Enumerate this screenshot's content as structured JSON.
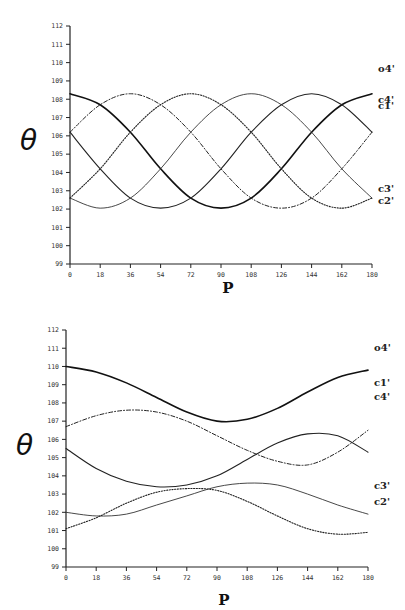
{
  "chart_data": [
    {
      "type": "line",
      "title": "",
      "xlabel": "P",
      "ylabel": "θ",
      "x": [
        0,
        18,
        36,
        54,
        72,
        90,
        108,
        126,
        144,
        162,
        180
      ],
      "xticks": [
        "0",
        "18",
        "36",
        "54",
        "72",
        "90",
        "108",
        "126",
        "144",
        "162",
        "180"
      ],
      "yticks": [
        "99",
        "100",
        "101",
        "102",
        "103",
        "104",
        "105",
        "106",
        "107",
        "108",
        "109",
        "110",
        "111",
        "112"
      ],
      "xlim": [
        0,
        180
      ],
      "ylim": [
        99,
        112
      ],
      "grid": false,
      "legend_position": "inline-right",
      "series": [
        {
          "name": "o4'",
          "style": "solid-thick",
          "values": [
            108.3,
            107.7,
            106.2,
            104.2,
            102.6,
            102.05,
            102.6,
            104.2,
            106.2,
            107.7,
            108.3
          ]
        },
        {
          "name": "c4'",
          "style": "solid",
          "values": [
            106.2,
            104.2,
            102.6,
            102.05,
            102.6,
            104.2,
            106.2,
            107.7,
            108.3,
            107.7,
            106.2
          ]
        },
        {
          "name": "c1'",
          "style": "dashdot",
          "values": [
            106.2,
            107.7,
            108.3,
            107.7,
            106.2,
            104.2,
            102.6,
            102.05,
            102.6,
            104.2,
            106.2
          ]
        },
        {
          "name": "c3'",
          "style": "solid-thin",
          "values": [
            102.6,
            102.05,
            102.6,
            104.2,
            106.2,
            107.7,
            108.3,
            107.7,
            106.2,
            104.2,
            102.6
          ]
        },
        {
          "name": "c2'",
          "style": "dotted",
          "values": [
            102.6,
            104.2,
            106.2,
            107.7,
            108.3,
            107.7,
            106.2,
            104.2,
            102.6,
            102.05,
            102.6
          ]
        }
      ]
    },
    {
      "type": "line",
      "title": "",
      "xlabel": "P",
      "ylabel": "θ",
      "x": [
        0,
        18,
        36,
        54,
        72,
        90,
        108,
        126,
        144,
        162,
        180
      ],
      "xticks": [
        "0",
        "18",
        "36",
        "54",
        "72",
        "90",
        "108",
        "126",
        "144",
        "162",
        "180"
      ],
      "yticks": [
        "99",
        "100",
        "101",
        "102",
        "103",
        "104",
        "105",
        "106",
        "107",
        "108",
        "109",
        "110",
        "111",
        "112"
      ],
      "xlim": [
        0,
        180
      ],
      "ylim": [
        99,
        112
      ],
      "grid": false,
      "legend_position": "inline-right",
      "series": [
        {
          "name": "o4'",
          "style": "solid-thick",
          "values": [
            110.0,
            109.7,
            109.1,
            108.3,
            107.5,
            107.0,
            107.1,
            107.7,
            108.6,
            109.4,
            109.8
          ]
        },
        {
          "name": "c1'",
          "style": "dashdot",
          "values": [
            106.7,
            107.3,
            107.6,
            107.5,
            107.0,
            106.2,
            105.4,
            104.8,
            104.6,
            105.3,
            106.5
          ]
        },
        {
          "name": "c4'",
          "style": "solid",
          "values": [
            105.5,
            104.4,
            103.7,
            103.4,
            103.5,
            104.0,
            104.9,
            105.8,
            106.3,
            106.2,
            105.3
          ]
        },
        {
          "name": "c3'",
          "style": "solid-thin",
          "values": [
            102.0,
            101.8,
            101.9,
            102.4,
            102.9,
            103.4,
            103.6,
            103.5,
            103.0,
            102.4,
            101.9
          ]
        },
        {
          "name": "c2'",
          "style": "dotted",
          "values": [
            101.1,
            101.7,
            102.5,
            103.1,
            103.3,
            103.2,
            102.6,
            101.8,
            101.1,
            100.8,
            100.9
          ]
        }
      ]
    }
  ],
  "layout": [
    {
      "plot": {
        "x0": 70,
        "x1": 372,
        "y_top": 26,
        "y_bottom": 264
      },
      "label_y": [
        68,
        99,
        105,
        188,
        200
      ],
      "ylabel_pos": [
        20,
        150
      ],
      "xlabel_pos": [
        228,
        293
      ]
    },
    {
      "plot": {
        "x0": 66,
        "x1": 368,
        "y_top": 25,
        "y_bottom": 262
      },
      "label_y": [
        42,
        77,
        91,
        180,
        196
      ],
      "ylabel_pos": [
        16,
        150
      ],
      "xlabel_pos": [
        224,
        300
      ]
    }
  ]
}
